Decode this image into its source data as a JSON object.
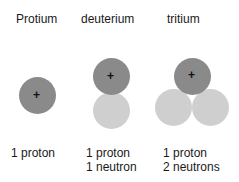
{
  "diagram": {
    "isotopes": [
      {
        "name": "Protium",
        "line1": "1 proton",
        "line2": ""
      },
      {
        "name": "deuterium",
        "line1": "1 proton",
        "line2": "1 neutron"
      },
      {
        "name": "tritium",
        "line1": "1 proton",
        "line2": "2 neutrons"
      }
    ],
    "proton_symbol": "+",
    "colors": {
      "proton": "#8a8a8a",
      "neutron": "#cfcfcf"
    }
  }
}
